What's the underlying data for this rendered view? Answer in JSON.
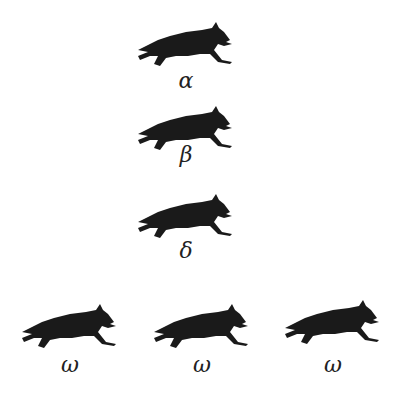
{
  "diagram": {
    "nodes": [
      {
        "id": "alpha",
        "label": "α",
        "icon": "wolf-running-icon",
        "x": 136,
        "y": 20
      },
      {
        "id": "beta",
        "label": "β",
        "icon": "wolf-running-icon",
        "x": 136,
        "y": 104
      },
      {
        "id": "delta",
        "label": "δ",
        "icon": "wolf-running-icon",
        "x": 136,
        "y": 192
      },
      {
        "id": "omega-1",
        "label": "ω",
        "icon": "wolf-running-icon",
        "x": 20,
        "y": 302
      },
      {
        "id": "omega-2",
        "label": "ω",
        "icon": "wolf-running-icon",
        "x": 152,
        "y": 302
      },
      {
        "id": "omega-3",
        "label": "ω",
        "icon": "wolf-running-icon",
        "x": 283,
        "y": 298
      }
    ],
    "colors": {
      "silhouette": "#1a1a1a",
      "background": "#ffffff"
    }
  }
}
